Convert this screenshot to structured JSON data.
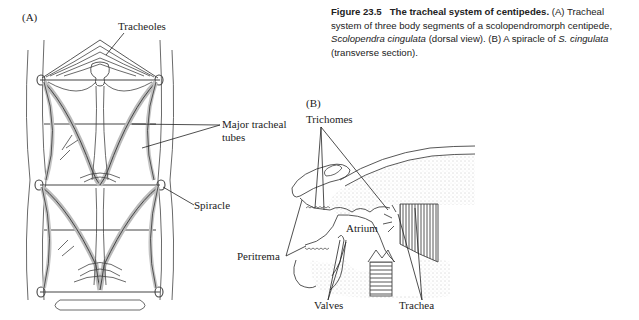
{
  "figure": {
    "number": "Figure 23.5",
    "title": "The tracheal system of centipedes.",
    "caption_parts": {
      "a_label": "(A)",
      "a_text_1": "Tracheal system of three body segments of a scolopendromorph centipede,",
      "a_species": "Scolopendra cingulata",
      "a_text_2": "(dorsal view).",
      "b_label": "(B)",
      "b_text_1": "A spiracle of",
      "b_species": "S. cingulata",
      "b_text_2": "(transverse section)."
    }
  },
  "panel_a": {
    "label": "(A)",
    "callouts": {
      "tracheoles": "Tracheoles",
      "major_tracheal_tubes_line1": "Major tracheal",
      "major_tracheal_tubes_line2": "tubes",
      "spiracle": "Spiracle"
    }
  },
  "panel_b": {
    "label": "(B)",
    "callouts": {
      "trichomes": "Trichomes",
      "peritrema": "Peritrema",
      "atrium": "Atrium",
      "valves": "Valves",
      "trachea": "Trachea"
    }
  }
}
